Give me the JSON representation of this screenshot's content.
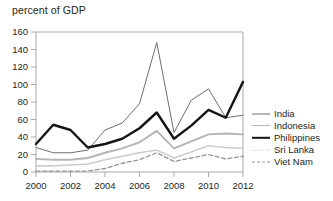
{
  "chart_data": {
    "type": "line",
    "title": "percent of GDP",
    "xlabel": "",
    "ylabel": "percent of GDP",
    "x": [
      2000,
      2001,
      2002,
      2003,
      2004,
      2005,
      2006,
      2007,
      2008,
      2009,
      2010,
      2011,
      2012
    ],
    "xlim": [
      2000,
      2012
    ],
    "ylim": [
      0,
      160
    ],
    "ytick_labels": [
      "0",
      "20",
      "40",
      "60",
      "80",
      "100",
      "120",
      "140",
      "160"
    ],
    "yticks": [
      0,
      20,
      40,
      60,
      80,
      100,
      120,
      140,
      160
    ],
    "xtick_labels": [
      "2000",
      "2002",
      "2004",
      "2006",
      "2008",
      "2010",
      "2012"
    ],
    "xticks": [
      2000,
      2002,
      2004,
      2006,
      2008,
      2010,
      2012
    ],
    "grid": false,
    "legend_position": "right",
    "series": [
      {
        "name": "India",
        "color": "#6d6e71",
        "style": "solid-thin",
        "values": [
          28,
          22,
          22,
          25,
          48,
          56,
          78,
          148,
          45,
          82,
          95,
          62,
          65
        ]
      },
      {
        "name": "Indonesia",
        "color": "#b4b5b7",
        "style": "solid-medium",
        "values": [
          15,
          14,
          14,
          16,
          22,
          27,
          34,
          47,
          27,
          35,
          43,
          44,
          43
        ]
      },
      {
        "name": "Philippines",
        "color": "#151515",
        "style": "solid-thick",
        "values": [
          32,
          54,
          48,
          28,
          32,
          38,
          50,
          68,
          38,
          53,
          71,
          62,
          103
        ]
      },
      {
        "name": "Sri Lanka",
        "color": "#c9cacb",
        "style": "dotted",
        "values": [
          7,
          7,
          8,
          9,
          14,
          18,
          22,
          25,
          16,
          23,
          30,
          28,
          27
        ]
      },
      {
        "name": "Viet Nam",
        "color": "#939598",
        "style": "dashed",
        "values": [
          1,
          1,
          1,
          1,
          4,
          10,
          14,
          22,
          12,
          16,
          20,
          15,
          18
        ]
      }
    ]
  }
}
